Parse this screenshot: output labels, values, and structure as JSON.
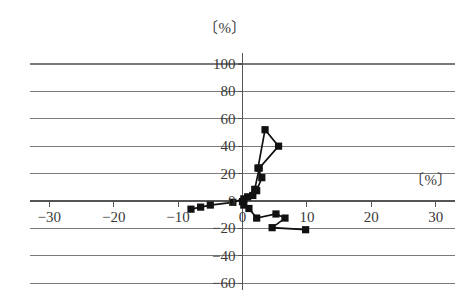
{
  "chart_data": {
    "type": "scatter",
    "title": "",
    "subtitle": "",
    "xlabel": "〔%〕",
    "ylabel": "〔%〕",
    "xlim": [
      -33,
      33
    ],
    "ylim": [
      -65,
      108
    ],
    "grid": true,
    "legend": null,
    "legend_position": "none",
    "marker": "filled-square",
    "line_style": "solid",
    "series": [
      {
        "name": "trajectory",
        "points": [
          [
            -8.0,
            -6.0
          ],
          [
            -6.5,
            -4.5
          ],
          [
            -5.0,
            -3.0
          ],
          [
            -1.5,
            -1.0
          ],
          [
            0.2,
            1.5
          ],
          [
            1.6,
            4.0
          ],
          [
            2.2,
            7.5
          ],
          [
            3.0,
            17.0
          ],
          [
            2.4,
            24.0
          ],
          [
            3.5,
            52.0
          ],
          [
            5.6,
            40.0
          ],
          [
            2.6,
            24.0
          ],
          [
            1.9,
            8.5
          ],
          [
            0.8,
            3.0
          ],
          [
            0.0,
            -0.5
          ],
          [
            0.2,
            -3.0
          ],
          [
            1.0,
            -5.5
          ],
          [
            2.2,
            -12.5
          ],
          [
            5.2,
            -9.5
          ],
          [
            6.6,
            -12.5
          ],
          [
            4.6,
            -19.5
          ],
          [
            9.8,
            -21.0
          ]
        ]
      }
    ],
    "xticks": [
      {
        "value": -30,
        "label": "−30"
      },
      {
        "value": -20,
        "label": "−20"
      },
      {
        "value": -10,
        "label": "−10"
      },
      {
        "value": 0,
        "label": "0"
      },
      {
        "value": 10,
        "label": "10"
      },
      {
        "value": 20,
        "label": "20"
      },
      {
        "value": 30,
        "label": "30"
      }
    ],
    "yticks": [
      {
        "value": 100,
        "label": "100"
      },
      {
        "value": 80,
        "label": "80"
      },
      {
        "value": 60,
        "label": "60"
      },
      {
        "value": 40,
        "label": "40"
      },
      {
        "value": 20,
        "label": "20"
      },
      {
        "value": 0,
        "label": "0"
      },
      {
        "value": -20,
        "label": "−20"
      },
      {
        "value": -40,
        "label": "−40"
      },
      {
        "value": -60,
        "label": "−60"
      }
    ],
    "colors": {
      "gridline": "#7a7a7a",
      "axis": "#555555",
      "series": "#111111",
      "background": "#ffffff",
      "text": "#3a3a3a"
    }
  }
}
